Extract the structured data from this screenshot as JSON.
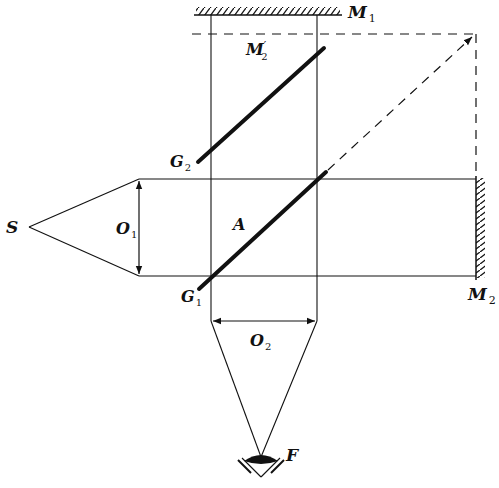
{
  "labels": {
    "source": "S",
    "lens1": {
      "main": "O",
      "sub": "1"
    },
    "lens2": {
      "main": "O",
      "sub": "2"
    },
    "mirror1": {
      "main": "M",
      "sub": "1"
    },
    "mirror2": {
      "main": "M",
      "sub": "2"
    },
    "mirror2_image": {
      "main": "M",
      "sub": "2",
      "prime": "′"
    },
    "plate1": {
      "main": "G",
      "sub": "1"
    },
    "plate2": {
      "main": "G",
      "sub": "2"
    },
    "point_a": "A",
    "eye": "F"
  },
  "colors": {
    "line": "#111111",
    "background": "#ffffff"
  }
}
